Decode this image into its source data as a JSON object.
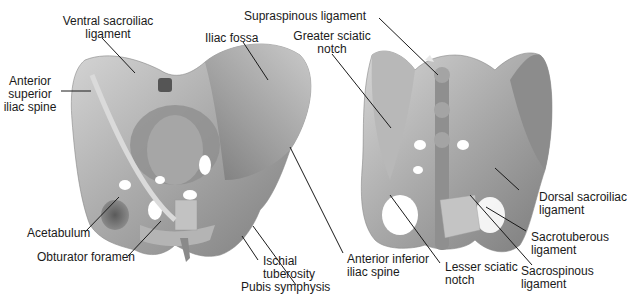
{
  "figure": {
    "type": "anatomical-illustration",
    "views": [
      {
        "name": "anterior-view-pelvis"
      },
      {
        "name": "posterior-view-pelvis"
      }
    ]
  },
  "labels": {
    "ventral_sacroiliac_1": "Ventral sacroiliac",
    "ventral_sacroiliac_2": "ligament",
    "anterior_superior_1": "Anterior",
    "anterior_superior_2": "superior",
    "anterior_superior_3": "iliac spine",
    "iliac_fossa": "Iliac fossa",
    "acetabulum": "Acetabulum",
    "obturator_foramen": "Obturator foramen",
    "ischial_1": "Ischial",
    "ischial_2": "tuberosity",
    "pubis_symphysis": "Pubis symphysis",
    "anterior_inferior_1": "Anterior inferior",
    "anterior_inferior_2": "iliac spine",
    "supraspinous": "Supraspinous ligament",
    "greater_sciatic_1": "Greater sciatic",
    "greater_sciatic_2": "notch",
    "lesser_sciatic_1": "Lesser sciatic",
    "lesser_sciatic_2": "notch",
    "dorsal_sacroiliac_1": "Dorsal sacroiliac",
    "dorsal_sacroiliac_2": "ligament",
    "sacrotuberous_1": "Sacrotuberous",
    "sacrotuberous_2": "ligament",
    "sacrospinous_1": "Sacrospinous",
    "sacrospinous_2": "ligament"
  },
  "colors": {
    "bone_light": "#c8c8c8",
    "bone_mid": "#9a9a9a",
    "bone_dark": "#6e6e6e",
    "leader_line": "#1a1a1a",
    "text": "#1a1a1a"
  }
}
